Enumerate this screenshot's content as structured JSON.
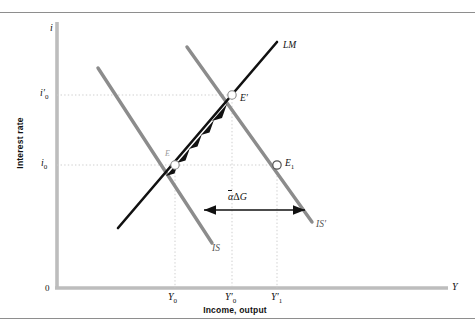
{
  "figure": {
    "axes": {
      "y_axis_symbol": "i",
      "x_axis_symbol": "Y",
      "y_axis_title": "Interest rate",
      "x_axis_title": "Income, output",
      "origin_label": "0"
    },
    "y_ticks": [
      {
        "name": "i-zero-prime",
        "base": "i",
        "prime": "′",
        "sub": "0",
        "y_px": 95
      },
      {
        "name": "i-zero",
        "base": "i",
        "prime": "",
        "sub": "0",
        "y_px": 165
      }
    ],
    "x_ticks": [
      {
        "name": "Y-zero",
        "base": "Y",
        "prime": "",
        "sub": "0",
        "x_px": 175
      },
      {
        "name": "Y-zero-prime",
        "base": "Y",
        "prime": "′",
        "sub": "0",
        "x_px": 232
      },
      {
        "name": "Y-one-prime",
        "base": "Y",
        "prime": "′",
        "sub": "1",
        "x_px": 277
      }
    ],
    "curves": [
      {
        "name": "IS",
        "label": "IS",
        "color": "#8c8c8c",
        "kind": "is-original"
      },
      {
        "name": "IS-prime",
        "label": "IS′",
        "color": "#8c8c8c",
        "kind": "is-shifted"
      },
      {
        "name": "LM",
        "label": "LM",
        "color": "#111111",
        "kind": "lm"
      }
    ],
    "points": [
      {
        "name": "E",
        "label": "E",
        "x_px": 175,
        "y_px": 165,
        "marker": "hollow-circle"
      },
      {
        "name": "E-prime",
        "label": "E′",
        "x_px": 232,
        "y_px": 95,
        "marker": "hollow-circle"
      },
      {
        "name": "E-one",
        "label": "E",
        "sub": "1",
        "x_px": 277,
        "y_px": 165,
        "marker": "hollow-circle"
      }
    ],
    "annotation": {
      "name": "shift-magnitude",
      "alpha": "α",
      "delta": "Δ",
      "variable": "G",
      "text": "αΔG",
      "arrow_from_x": 204,
      "arrow_to_x": 305,
      "arrow_y": 210
    },
    "colors": {
      "is_curve": "#8c8c8c",
      "lm_curve": "#111111",
      "axis": "#b8b8b8",
      "gridline": "#cccccc",
      "rule": "#8e8e8e",
      "background": "#ffffff"
    }
  }
}
